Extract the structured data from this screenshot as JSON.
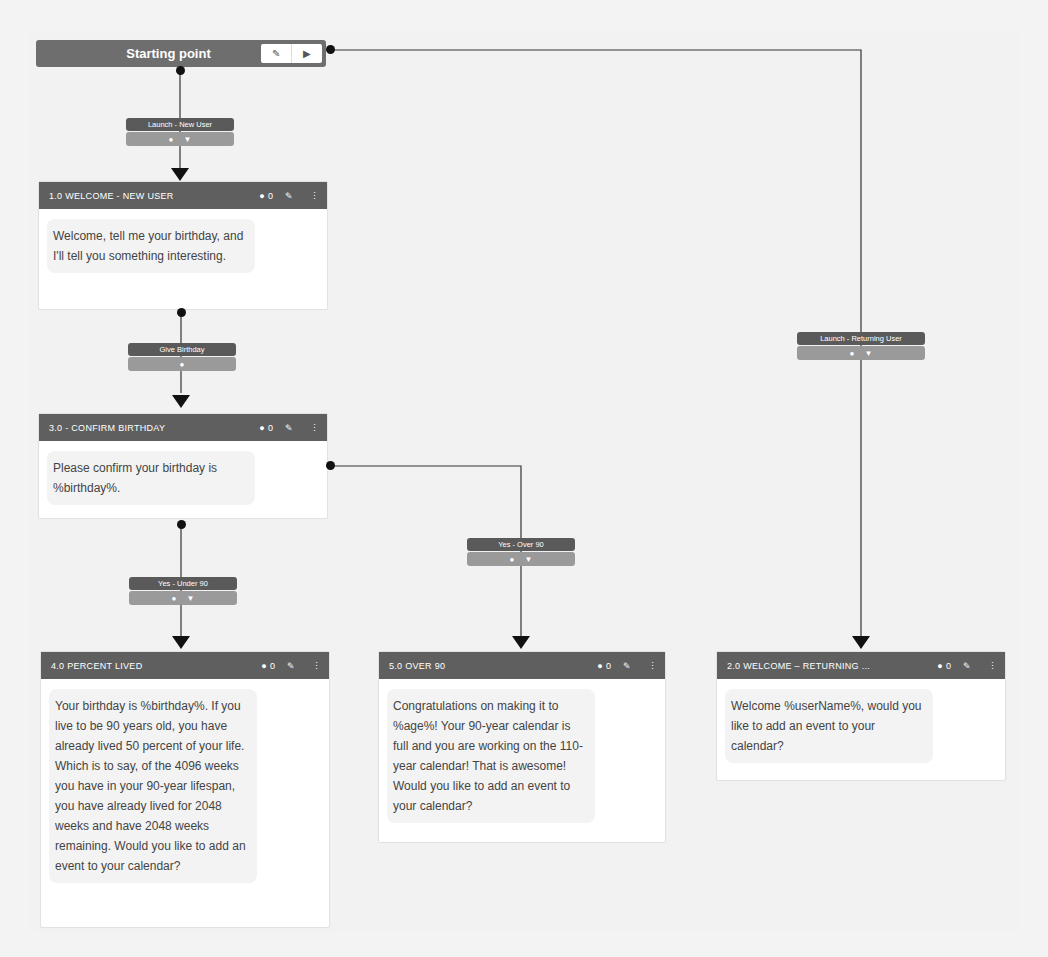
{
  "start": {
    "title": "Starting point",
    "buttons": [
      {
        "icon": "edit-icon",
        "glyph": "✎"
      },
      {
        "icon": "play-icon",
        "glyph": "▶"
      }
    ]
  },
  "edges": [
    {
      "id": "launch-new-user",
      "label": "Launch - New User",
      "icons": [
        "speech-bubble-icon",
        "filter-icon"
      ]
    },
    {
      "id": "give-birthday",
      "label": "Give Birthday",
      "icons": [
        "speech-bubble-icon"
      ]
    },
    {
      "id": "yes-under-90",
      "label": "Yes - Under 90",
      "icons": [
        "speech-bubble-icon",
        "filter-icon"
      ]
    },
    {
      "id": "yes-over-90",
      "label": "Yes - Over 90",
      "icons": [
        "speech-bubble-icon",
        "filter-icon"
      ]
    },
    {
      "id": "launch-returning-user",
      "label": "Launch - Returning User",
      "icons": [
        "speech-bubble-icon",
        "filter-icon"
      ]
    }
  ],
  "nodes": [
    {
      "id": "welcome-new-user",
      "title": "1.0 WELCOME - NEW USER",
      "comment_count": "0",
      "text": "Welcome, tell me your birthday, and I'll tell you something interesting."
    },
    {
      "id": "confirm-birthday",
      "title": "3.0 - CONFIRM BIRTHDAY",
      "comment_count": "0",
      "text": "Please confirm your birthday is %birthday%."
    },
    {
      "id": "percent-lived",
      "title": "4.0 PERCENT LIVED",
      "comment_count": "0",
      "text": "Your birthday is %birthday%. If you live to be 90 years old, you have already lived 50 percent of your life. Which is to say, of the 4096 weeks you have in your 90-year lifespan, you have already lived for 2048 weeks and have 2048 weeks remaining. Would you like to add an event to your calendar?"
    },
    {
      "id": "over-90",
      "title": "5.0 OVER 90",
      "comment_count": "0",
      "text": "Congratulations on making it to %age%! Your 90-year calendar is full and you are working on the 110-year calendar! That is awesome! Would you like to add an event to your calendar?"
    },
    {
      "id": "welcome-returning",
      "title": "2.0 WELCOME – RETURNING ...",
      "comment_count": "0",
      "text": "Welcome %userName%, would you like to add an event to your calendar?"
    }
  ],
  "icons": {
    "comment": "💬",
    "edit": "✎",
    "menu": "⋮",
    "speech": "●",
    "filter": "▼"
  }
}
